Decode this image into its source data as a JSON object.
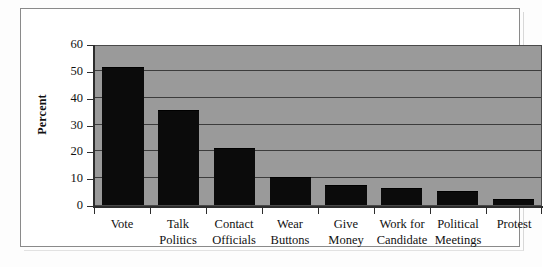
{
  "chart_data": {
    "type": "bar",
    "title": "",
    "xlabel": "",
    "ylabel": "Percent",
    "ylim": [
      0,
      60
    ],
    "yticks": [
      0,
      10,
      20,
      30,
      40,
      50,
      60
    ],
    "grid": true,
    "legend": null,
    "categories": [
      "Vote",
      "Talk Politics",
      "Contact Officials",
      "Wear Buttons",
      "Give Money",
      "Work for Candidate",
      "Political Meetings",
      "Protest"
    ],
    "category_lines": [
      [
        "Vote"
      ],
      [
        "Talk",
        "Politics"
      ],
      [
        "Contact",
        "Officials"
      ],
      [
        "Wear",
        "Buttons"
      ],
      [
        "Give",
        "Money"
      ],
      [
        "Work for",
        "Candidate"
      ],
      [
        "Political",
        "Meetings"
      ],
      [
        "Protest"
      ]
    ],
    "values": [
      51,
      35,
      21,
      10,
      7,
      6,
      5,
      2
    ],
    "colors": {
      "bar": "#0b0b0b",
      "plot_background": "#9a9a9a",
      "gridline": "#3c3c3c",
      "axis": "#2d2d2d",
      "figure_background": "#ffffff",
      "frame_border": "#8a8a8a",
      "text": "#111111"
    }
  }
}
